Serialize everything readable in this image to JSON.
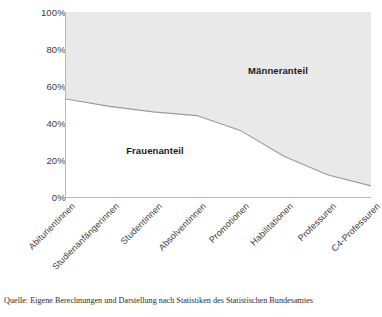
{
  "chart_data": {
    "type": "area",
    "title": "",
    "subtitle": "",
    "xlabel": "",
    "ylabel": "",
    "ylim": [
      0,
      100
    ],
    "grid": false,
    "legend_position": "in-plot",
    "stacked": true,
    "categories": [
      "Abiturientinnen",
      "Studienanfängerinnen",
      "Studentinnen",
      "Absolventinnen",
      "Promotionen",
      "Habilitationen",
      "Professuren",
      "C4-Professuren"
    ],
    "series": [
      {
        "name": "Frauenanteil",
        "values": [
          53,
          49,
          46,
          44,
          36,
          22,
          12,
          6
        ]
      },
      {
        "name": "Männeranteil",
        "values": [
          47,
          51,
          54,
          56,
          64,
          78,
          88,
          94
        ]
      }
    ],
    "ytick_labels": [
      "0%",
      "20%",
      "40%",
      "60%",
      "80%",
      "100%"
    ],
    "ytick_values": [
      0,
      20,
      40,
      60,
      80,
      100
    ],
    "annotations": [
      {
        "text": "Männeranteil",
        "series": "Männeranteil"
      },
      {
        "text": "Frauenanteil",
        "series": "Frauenanteil"
      }
    ],
    "colors": {
      "frauenanteil_fill": "#ffffff",
      "maenneranteil_fill": "#e9e9e9",
      "curve": "#9a9a9a",
      "axis": "#b9b9b9",
      "text": "#3a3a3a"
    }
  },
  "source": {
    "text": "Quelle: Eigene Berechnungen und Darstellung nach Statistiken des Statistischen Bundesamtes"
  }
}
